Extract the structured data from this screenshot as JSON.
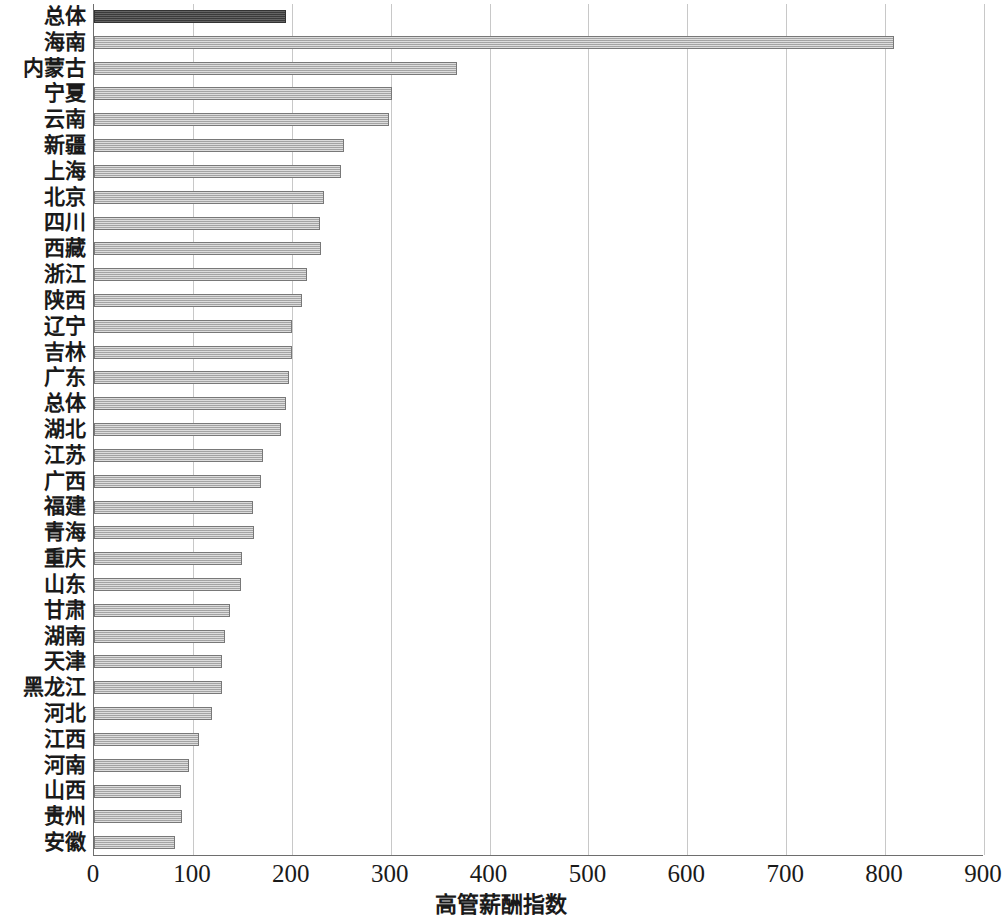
{
  "chart_data": {
    "type": "bar",
    "orientation": "horizontal",
    "title": "",
    "xlabel": "高管薪酬指数",
    "ylabel": "",
    "xlim": [
      0,
      900
    ],
    "xticks": [
      0,
      100,
      200,
      300,
      400,
      500,
      600,
      700,
      800,
      900
    ],
    "xtick_labels": [
      "0",
      "100",
      "200",
      "300",
      "400",
      "500",
      "600",
      "700",
      "800",
      "900"
    ],
    "grid": "vertical",
    "legend": "none",
    "highlight_index": 0,
    "colors": {
      "bar": "#b4b4b4",
      "bar_border": "#787878",
      "bar_highlight": "#4a4a4a",
      "bar_highlight_border": "#333333",
      "gridline": "#c8c8c8",
      "axis": "#6e6e6e",
      "text": "#1a1a1a"
    },
    "categories": [
      "总体",
      "海南",
      "内蒙古",
      "宁夏",
      "云南",
      "新疆",
      "上海",
      "北京",
      "四川",
      "西藏",
      "浙江",
      "陕西",
      "辽宁",
      "吉林",
      "广东",
      "总体",
      "湖北",
      "江苏",
      "广西",
      "福建",
      "青海",
      "重庆",
      "山东",
      "甘肃",
      "湖南",
      "天津",
      "黑龙江",
      "河北",
      "江西",
      "河南",
      "山西",
      "贵州",
      "安徽"
    ],
    "values": [
      194,
      809,
      367,
      301,
      298,
      253,
      250,
      233,
      229,
      230,
      215,
      210,
      200,
      200,
      197,
      194,
      189,
      171,
      169,
      161,
      162,
      150,
      149,
      138,
      132,
      129,
      129,
      119,
      106,
      96,
      88,
      89,
      82
    ]
  }
}
